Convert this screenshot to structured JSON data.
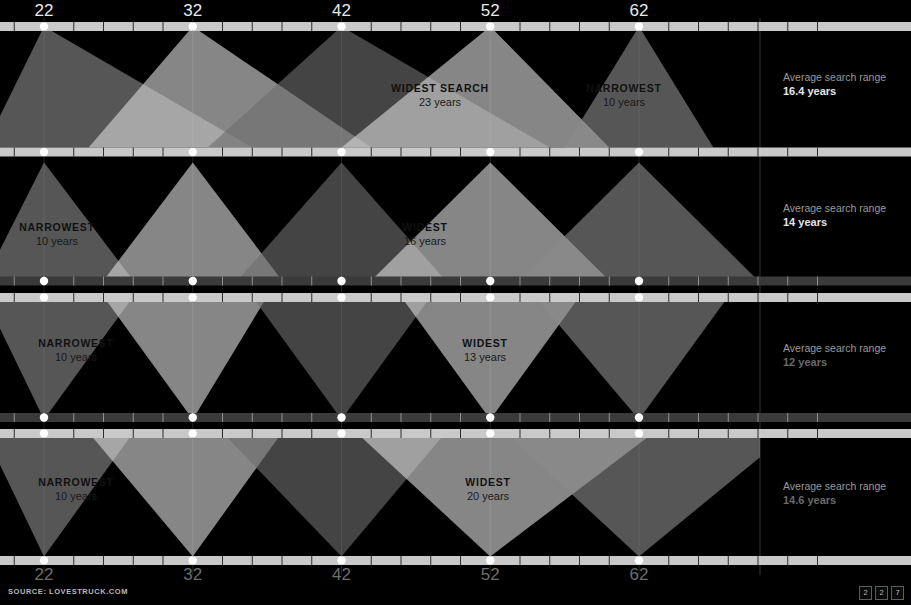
{
  "source": {
    "text": "SOURCE: LOVESTRUCK.COM"
  },
  "page_marks": [
    "2",
    "2",
    "7"
  ],
  "axis": {
    "ticks": [
      22,
      32,
      42,
      52,
      62
    ],
    "top_labels": [
      "22",
      "32",
      "42",
      "52",
      "62"
    ],
    "bottom_labels": [
      "22",
      "32",
      "42",
      "52",
      "62"
    ],
    "min": 18,
    "max": 74,
    "minor_tick_step": 2
  },
  "panels": [
    {
      "id": "panel-1",
      "side_label": "Average search range",
      "side_value": "16.4 years",
      "callouts": [
        {
          "title": "WIDEST SEARCH",
          "value": "23 years",
          "x": 440,
          "y": 92
        },
        {
          "title": "NARROWEST",
          "value": "10 years",
          "x": 624,
          "y": 92
        }
      ]
    },
    {
      "id": "panel-2",
      "side_label": "Average search range",
      "side_value": "14 years",
      "callouts": [
        {
          "title": "NARROWEST",
          "value": "10 years",
          "x": 57,
          "y": 231
        },
        {
          "title": "WIDEST",
          "value": "16 years",
          "x": 425,
          "y": 231
        }
      ]
    },
    {
      "id": "panel-3",
      "side_label": "Average search range",
      "side_value": "12 years",
      "callouts": [
        {
          "title": "NARROWEST",
          "value": "10 years",
          "x": 76,
          "y": 347
        },
        {
          "title": "WIDEST",
          "value": "13 years",
          "x": 485,
          "y": 347
        }
      ]
    },
    {
      "id": "panel-4",
      "side_label": "Average search range",
      "side_value": "14.6 years",
      "callouts": [
        {
          "title": "NARROWEST",
          "value": "10 years",
          "x": 76,
          "y": 486
        },
        {
          "title": "WIDEST",
          "value": "20 years",
          "x": 488,
          "y": 486
        }
      ]
    }
  ],
  "colors": {
    "background": "#000000",
    "axis_bar": "#c9c9c9",
    "axis_bar_dark": "#3a3a3a",
    "wedge_mid": "#8a8a8a",
    "wedge_light": "#d8d8d8",
    "wedge_dark": "#6e6e6e",
    "dot": "#ffffff",
    "top_tick_label": "#e9e9e9",
    "bottom_tick_label": "#6e6e6e",
    "side_label": "#9a9a9a",
    "side_value_bright": "#e6e6e6",
    "side_value_dim": "#6a6a6a"
  },
  "chart_data": {
    "type": "area",
    "xlabel": "Age",
    "ylabel": "",
    "xlim": [
      18,
      74
    ],
    "categories": [
      "22",
      "32",
      "42",
      "52",
      "62"
    ],
    "grid": true,
    "legend": "none",
    "note": "Each panel: a wedge originates at the searcher's age on one axis and spreads across the ages they search for on the opposite axis.",
    "series": [
      {
        "name": "Panel 1 - search range (from top age)",
        "average_search_range_years": 16.4,
        "widest_years": 23,
        "narrowest_years": 10,
        "values": [
          {
            "age": 22,
            "low": 18,
            "high": 36,
            "range": 18
          },
          {
            "age": 32,
            "low": 25,
            "high": 44,
            "range": 19
          },
          {
            "age": 42,
            "low": 33,
            "high": 56,
            "range": 23
          },
          {
            "age": 52,
            "low": 42,
            "high": 60,
            "range": 18
          },
          {
            "age": 62,
            "low": 57,
            "high": 67,
            "range": 10
          }
        ]
      },
      {
        "name": "Panel 2 - search range (from top age)",
        "average_search_range_years": 14,
        "widest_years": 16,
        "narrowest_years": 10,
        "values": [
          {
            "age": 22,
            "low": 18,
            "high": 28,
            "range": 10
          },
          {
            "age": 32,
            "low": 26,
            "high": 38,
            "range": 12
          },
          {
            "age": 42,
            "low": 35,
            "high": 49,
            "range": 14
          },
          {
            "age": 52,
            "low": 44,
            "high": 60,
            "range": 16
          },
          {
            "age": 62,
            "low": 54,
            "high": 70,
            "range": 16
          }
        ]
      },
      {
        "name": "Panel 3 - search range (to bottom age)",
        "average_search_range_years": 12,
        "widest_years": 13,
        "narrowest_years": 10,
        "values": [
          {
            "age": 22,
            "low": 18,
            "high": 28,
            "range": 10
          },
          {
            "age": 32,
            "low": 26,
            "high": 37,
            "range": 11
          },
          {
            "age": 42,
            "low": 36,
            "high": 48,
            "range": 12
          },
          {
            "age": 52,
            "low": 46,
            "high": 58,
            "range": 12
          },
          {
            "age": 62,
            "low": 55,
            "high": 68,
            "range": 13
          }
        ]
      },
      {
        "name": "Panel 4 - search range (to bottom age)",
        "average_search_range_years": 14.6,
        "widest_years": 20,
        "narrowest_years": 10,
        "values": [
          {
            "age": 22,
            "low": 18,
            "high": 28,
            "range": 10
          },
          {
            "age": 32,
            "low": 25,
            "high": 38,
            "range": 13
          },
          {
            "age": 42,
            "low": 34,
            "high": 49,
            "range": 15
          },
          {
            "age": 52,
            "low": 43,
            "high": 63,
            "range": 20
          },
          {
            "age": 62,
            "low": 53,
            "high": 74,
            "range": 21
          }
        ]
      }
    ]
  }
}
